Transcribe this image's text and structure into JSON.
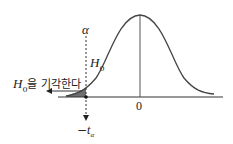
{
  "diagram": {
    "type": "normal-distribution-left-tail-test",
    "alpha_label": "α",
    "null_label_main": "H",
    "null_label_sub": "0",
    "reject_label_main": "H",
    "reject_label_sub": "0",
    "reject_label_text": "을 기각한다",
    "center_tick_label": "0",
    "critical_value_sign": "−",
    "critical_value_main": "t",
    "critical_value_sub": "α",
    "colors": {
      "curve": "#444444",
      "axis": "#333333",
      "shade": "#555555",
      "text": "#222222"
    }
  }
}
